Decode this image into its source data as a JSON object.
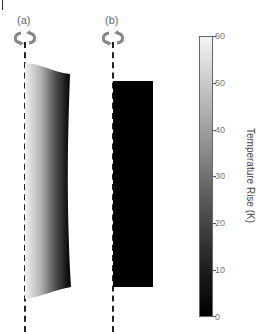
{
  "figure": {
    "panels": [
      {
        "id": "a",
        "label": "(a)",
        "rotation_icon": "rotate-icon",
        "description": "tapered cylinder with gradient temperature"
      },
      {
        "id": "b",
        "label": "(b)",
        "rotation_icon": "rotate-icon",
        "description": "uniform black rectangle"
      }
    ],
    "colorbar": {
      "title": "Temperature Rise (K)",
      "ticks": [
        "60",
        "50",
        "40",
        "30",
        "20",
        "10",
        "0"
      ],
      "min": 0,
      "max": 60,
      "colormap": "gray",
      "colors": {
        "high": "#f4f4f4",
        "low": "#000000"
      }
    }
  }
}
